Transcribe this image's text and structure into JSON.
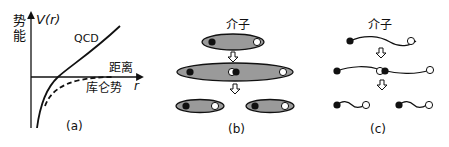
{
  "panel_a": {
    "caption": "(a)",
    "y_axis_label_cn": "势能",
    "y_axis_label_line1": "势",
    "y_axis_label_line2": "能",
    "y_axis_symbol": "V(r)",
    "x_axis_label_cn": "距离",
    "x_axis_symbol": "r",
    "curve_qcd_label": "QCD",
    "curve_coulomb_label": "库仑势"
  },
  "panel_b": {
    "caption": "(b)",
    "title": "介子",
    "stages": [
      "meson",
      "stretched flux tube with new pair",
      "two mesons"
    ]
  },
  "panel_c": {
    "caption": "(c)",
    "title": "介子",
    "stages": [
      "meson string",
      "string breaks with new pair",
      "two meson strings"
    ]
  },
  "colors": {
    "ink": "#111111",
    "tube_fill": "#9a9a9a",
    "background": "#ffffff"
  }
}
